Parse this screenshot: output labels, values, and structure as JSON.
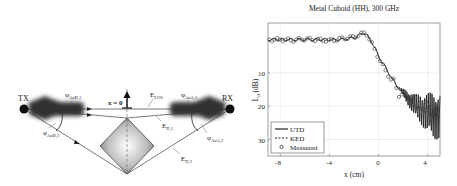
{
  "diagram": {
    "tx_label": "TX",
    "rx_label": "RX",
    "origin_label": "x = 0",
    "fields": {
      "los": {
        "main": "E",
        "sub": "LOS"
      },
      "d1": {
        "main": "E",
        "sub": "D,1"
      },
      "d2": {
        "main": "E",
        "sub": "D,2"
      }
    },
    "angles": {
      "aod1": {
        "main": "φ",
        "sub": "AoD,1"
      },
      "aod2": {
        "main": "φ",
        "sub": "AoD,2"
      },
      "aoa1": {
        "main": "φ",
        "sub": "AoA,1"
      },
      "aoa2": {
        "main": "φ",
        "sub": "AoA,2"
      }
    },
    "object": "metal cuboid (diamond cross-section)"
  },
  "chart": {
    "title": "Metal Cuboid (HH), 300 GHz",
    "xlabel": "x (cm)",
    "ylabel_main": "L",
    "ylabel_sub": "d",
    "ylabel_unit": " (dB)",
    "xticks": [
      "-8",
      "-4",
      "0",
      "4"
    ],
    "yticks": [
      "10",
      "20",
      "30"
    ],
    "legend": [
      "UTD",
      "KED",
      "Measured"
    ]
  },
  "chart_data": {
    "type": "line",
    "title": "Metal Cuboid (HH), 300 GHz",
    "xlabel": "x (cm)",
    "ylabel": "L_d (dB)",
    "xlim": [
      -9,
      5
    ],
    "ylim": [
      35,
      -5
    ],
    "y_inverted": true,
    "grid": true,
    "legend_position": "lower left",
    "xticks": [
      -8,
      -4,
      0,
      4
    ],
    "yticks": [
      10,
      20,
      30
    ],
    "x": [
      -9,
      -8,
      -7,
      -6,
      -5,
      -4,
      -3,
      -2,
      -1.5,
      -1.2,
      -1,
      -0.5,
      0,
      0.5,
      1,
      1.5,
      2,
      2.5,
      3,
      3.5,
      4,
      4.5,
      5
    ],
    "series": [
      {
        "name": "UTD",
        "style": "solid",
        "values": [
          0,
          0,
          0,
          0,
          0,
          0,
          0,
          -0.5,
          -1.5,
          -2,
          -1.5,
          1,
          5,
          8,
          11,
          14,
          16,
          18,
          20,
          21,
          22,
          23,
          23
        ]
      },
      {
        "name": "KED",
        "style": "dashed",
        "values": [
          0,
          0,
          0,
          0,
          0,
          0,
          0,
          -0.5,
          -1.5,
          -2,
          -1.5,
          1,
          5,
          8,
          11,
          14,
          16,
          18,
          20,
          21,
          22,
          23,
          23
        ]
      },
      {
        "name": "Measured",
        "style": "markers-circle",
        "values": [
          0,
          0,
          0.2,
          -0.2,
          0,
          0.3,
          -0.3,
          -0.8,
          -1.5,
          -2,
          -1.8,
          1.5,
          5.5,
          9,
          12,
          15,
          17,
          17.5,
          19,
          22,
          19.5,
          22,
          22
        ]
      }
    ],
    "annotations": [
      "UTD shows strong oscillation (≈20–35 dB) for x > 2 cm"
    ]
  }
}
